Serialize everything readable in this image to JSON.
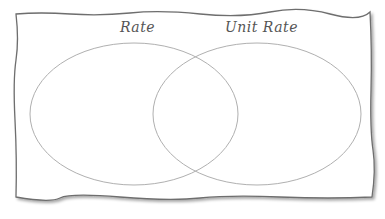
{
  "diagram": {
    "type": "venn",
    "sets": [
      {
        "label": "Rate"
      },
      {
        "label": "Unit Rate"
      }
    ],
    "colors": {
      "border": "#6e6e6e",
      "ellipse": "#b0b0b0",
      "text": "#555555",
      "background": "#ffffff"
    }
  }
}
